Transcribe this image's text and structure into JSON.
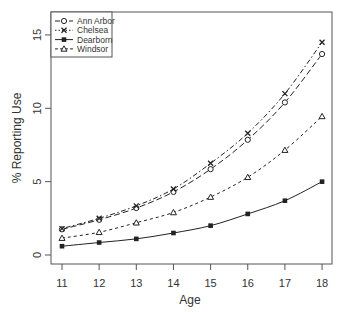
{
  "chart_data": {
    "type": "line",
    "title": "",
    "xlabel": "Age",
    "ylabel": "% Reporting Use",
    "x": [
      11,
      12,
      13,
      14,
      15,
      16,
      17,
      18
    ],
    "xticks": [
      "11",
      "12",
      "13",
      "14",
      "15",
      "16",
      "17",
      "18"
    ],
    "yticks": [
      "0",
      "5",
      "10",
      "15"
    ],
    "ytick_values": [
      0,
      5,
      10,
      15
    ],
    "xlim": [
      10.7,
      18.3
    ],
    "ylim": [
      -0.6,
      16.2
    ],
    "grid": false,
    "legend_position": "top-left",
    "series": [
      {
        "name": "Ann Arbor",
        "marker": "diamond-cross",
        "linestyle": "longdash",
        "values": [
          1.75,
          2.4,
          3.2,
          4.3,
          5.85,
          7.85,
          10.4,
          13.7
        ]
      },
      {
        "name": "Chelsea",
        "marker": "x",
        "linestyle": "dotdash",
        "values": [
          1.8,
          2.5,
          3.35,
          4.5,
          6.25,
          8.3,
          11.0,
          14.5
        ]
      },
      {
        "name": "Dearborn",
        "marker": "square-filled",
        "linestyle": "solid",
        "values": [
          0.6,
          0.85,
          1.1,
          1.5,
          2.0,
          2.8,
          3.7,
          5.0
        ]
      },
      {
        "name": "Windsor",
        "marker": "triangle",
        "linestyle": "dashed",
        "values": [
          1.15,
          1.55,
          2.2,
          2.9,
          3.95,
          5.3,
          7.15,
          9.45
        ]
      }
    ]
  },
  "colors": {
    "line": "#222222",
    "axis": "#555555",
    "text": "#333333"
  }
}
